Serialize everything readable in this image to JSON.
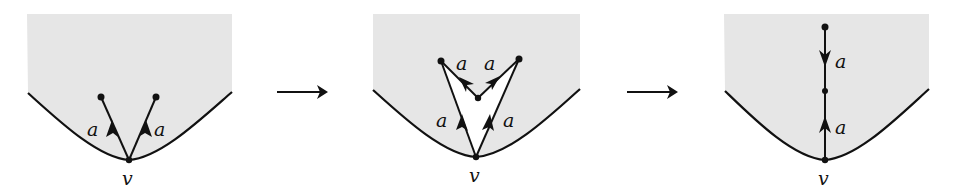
{
  "colors": {
    "background": "#ffffff",
    "region_fill": "#e6e6e6",
    "stroke": "#111111",
    "inner_fill": "#ffffff"
  },
  "panels": [
    {
      "id": "panel-1",
      "vertex_label": "v",
      "edge_labels": [
        "a",
        "a"
      ],
      "description": "Two edges labeled a oriented away from boundary vertex v into the shaded region"
    },
    {
      "id": "panel-2",
      "vertex_label": "v",
      "edge_labels": [
        "a",
        "a",
        "a",
        "a"
      ],
      "description": "Folding step: the two a-edges and two further a-edges meeting at an interior vertex, enclosing a white region"
    },
    {
      "id": "panel-3",
      "vertex_label": "v",
      "edge_labels": [
        "a",
        "a"
      ],
      "description": "Result: single vertical path from v with two a-edges, one pointing up and one pointing down to a middle vertex"
    }
  ],
  "transitions": [
    {
      "from": "panel-1",
      "to": "panel-2",
      "symbol": "right-arrow"
    },
    {
      "from": "panel-2",
      "to": "panel-3",
      "symbol": "right-arrow"
    }
  ]
}
